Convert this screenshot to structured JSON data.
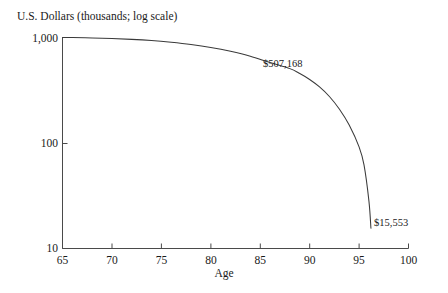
{
  "chart_data": {
    "type": "line",
    "title": "",
    "ylabel": "U.S. Dollars (thousands; log scale)",
    "xlabel": "Age",
    "xlim": [
      65,
      100
    ],
    "ylim": [
      10,
      1000
    ],
    "yscale": "log",
    "grid": false,
    "legend": false,
    "xticks": [
      65,
      70,
      75,
      80,
      85,
      90,
      95,
      100
    ],
    "xtick_labels": [
      "65",
      "70",
      "75",
      "80",
      "85",
      "90",
      "95",
      "100"
    ],
    "yticks": [
      10,
      100,
      1000
    ],
    "ytick_labels": [
      "10",
      "100",
      "1,000"
    ],
    "series": [
      {
        "name": "Portfolio balance",
        "x": [
          65,
          66,
          68,
          70,
          72,
          74,
          76,
          78,
          80,
          82,
          84,
          86,
          88,
          89,
          90,
          91,
          92,
          93,
          94,
          95,
          95.5,
          96,
          96.2
        ],
        "values": [
          1000,
          998,
          990,
          978,
          960,
          935,
          900,
          858,
          805,
          740,
          665,
          578,
          507,
          455,
          400,
          340,
          276,
          210,
          148,
          92,
          62,
          28,
          15.553
        ]
      }
    ],
    "annotations": [
      {
        "label": "$507,168",
        "x": 88,
        "y": 507.168,
        "placement": "above-right"
      },
      {
        "label": "$15,553",
        "x": 96.2,
        "y": 15.553,
        "placement": "right"
      }
    ],
    "colors": {
      "line": "#3a3a3a",
      "axis": "#4a4a4a",
      "text": "#1a1a1a",
      "background": "#ffffff"
    }
  }
}
